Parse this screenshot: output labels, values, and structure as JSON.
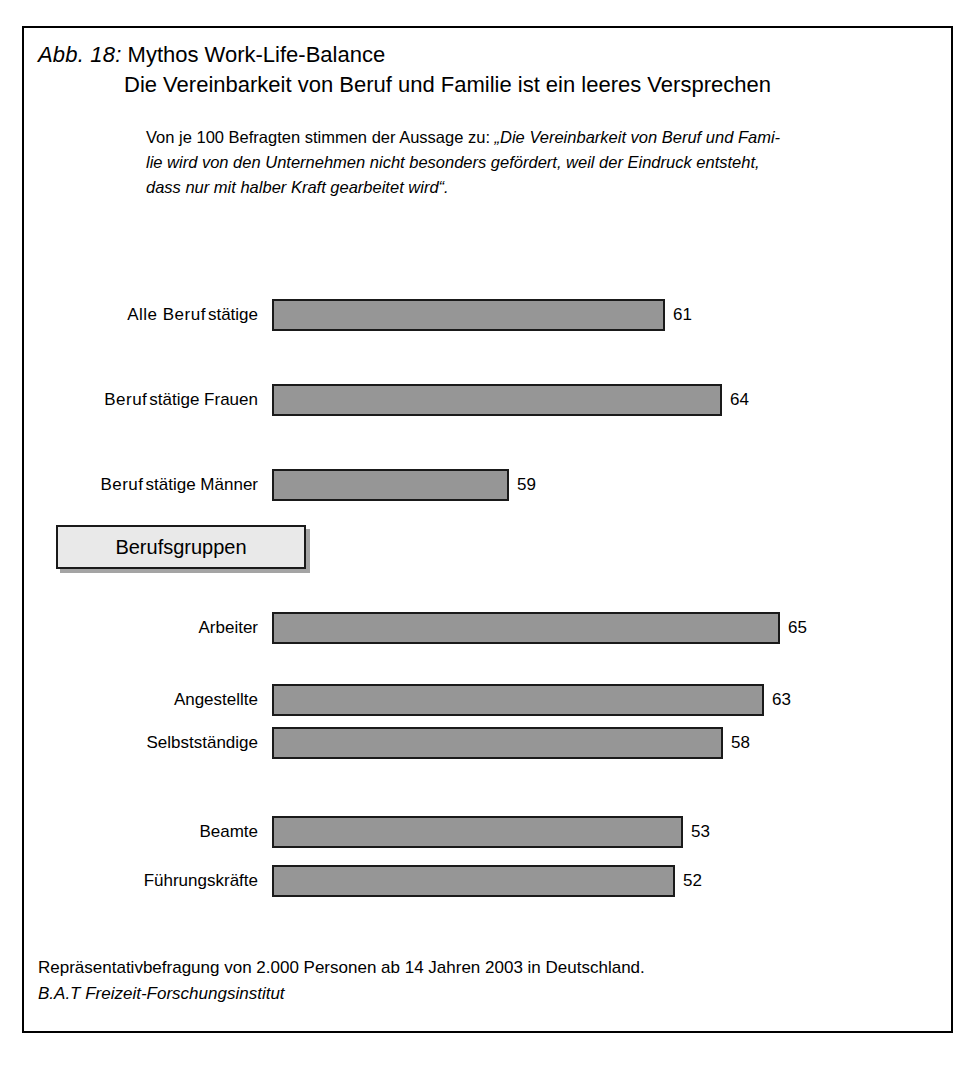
{
  "figure": {
    "number_label": "Abb. 18:",
    "title": "Mythos Work-Life-Balance",
    "subtitle": "Die Vereinbarkeit von Beruf und Familie ist ein leeres Versprechen",
    "intro_line_1": "Von je 100 Befragten stimmen der Aussage zu: ",
    "intro_quote_1": "„Die Vereinbarkeit von Beruf und Fami-",
    "intro_quote_2": "lie wird von den Unternehmen nicht besonders gefördert, weil der Eindruck entsteht,",
    "intro_quote_3": "dass nur mit halber Kraft gearbeitet wird“.",
    "group_divider": "Berufsgruppen",
    "footer_line_1": "Repräsentativbefragung von 2.000 Personen ab 14 Jahren 2003 in Deutschland.",
    "footer_line_2": "B.A.T Freizeit-Forschungsinstitut",
    "frame_color": "#000000",
    "bar_fill_color": "#969696",
    "bar_border_color": "#1a1a1a",
    "group_box_fill": "#e9e9e9"
  },
  "chart_data": {
    "type": "bar",
    "orientation": "horizontal",
    "title": "Mythos Work-Life-Balance",
    "subtitle": "Die Vereinbarkeit von Beruf und Familie ist ein leeres Versprechen",
    "xlabel": "",
    "ylabel": "",
    "unit": "Von je 100 Befragten",
    "xlim": [
      0,
      65
    ],
    "grid": false,
    "legend": false,
    "categories": [
      "Alle Berufstätige",
      "Berufstätige Frauen",
      "Berufstätige Männer",
      "Arbeiter",
      "Angestellte",
      "Selbstständige",
      "Beamte",
      "Führungskräfte"
    ],
    "values": [
      61,
      64,
      59,
      65,
      63,
      58,
      53,
      52
    ],
    "group_divider_after_index": 2,
    "group_divider_label": "Berufsgruppen",
    "bars": [
      {
        "label_a": "Alle Beruf",
        "label_b": "stätige",
        "value": 61,
        "value_text": "61",
        "top": 270,
        "width": 393
      },
      {
        "label_a": "Beruf",
        "label_b": "stätige Frauen",
        "value": 64,
        "value_text": "64",
        "top": 355,
        "width": 450
      },
      {
        "label_a": "Beruf",
        "label_b": "stätige Männer",
        "value": 59,
        "value_text": "59",
        "top": 440,
        "width": 237
      },
      {
        "label_a": "",
        "label_b": "Arbeiter",
        "value": 65,
        "value_text": "65",
        "top": 583,
        "width": 508
      },
      {
        "label_a": "",
        "label_b": "Angestellte",
        "value": 63,
        "value_text": "63",
        "top": 655,
        "width": 492
      },
      {
        "label_a": "",
        "label_b": "Selbstständige",
        "value": 58,
        "value_text": "58",
        "top": 698,
        "width": 451
      },
      {
        "label_a": "",
        "label_b": "Beamte",
        "value": 53,
        "value_text": "53",
        "top": 787,
        "width": 411
      },
      {
        "label_a": "",
        "label_b": "Führungskräfte",
        "value": 52,
        "value_text": "52",
        "top": 836,
        "width": 403
      }
    ]
  }
}
